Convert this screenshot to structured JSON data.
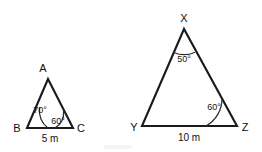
{
  "figure": {
    "background_color": "#ffffff",
    "stroke_color": "#1a1a1a",
    "text_color": "#111111",
    "triangles": [
      {
        "id": "abc",
        "name": "triangle-abc",
        "vertices": [
          {
            "label": "A",
            "role": "apex",
            "x": 48,
            "y": 79
          },
          {
            "label": "B",
            "role": "base-left",
            "x": 27,
            "y": 128
          },
          {
            "label": "C",
            "role": "base-right",
            "x": 73,
            "y": 128
          }
        ],
        "angles": [
          {
            "at": "B",
            "value": "70°"
          },
          {
            "at": "C",
            "value": "60°"
          }
        ],
        "sides": [
          {
            "between": "BC",
            "value": "5 m"
          }
        ]
      },
      {
        "id": "xyz",
        "name": "triangle-xyz",
        "vertices": [
          {
            "label": "X",
            "role": "apex",
            "x": 184,
            "y": 29
          },
          {
            "label": "Y",
            "role": "base-left",
            "x": 142,
            "y": 126
          },
          {
            "label": "Z",
            "role": "base-right",
            "x": 237,
            "y": 126
          }
        ],
        "angles": [
          {
            "at": "X",
            "value": "50°"
          },
          {
            "at": "Z",
            "value": "60°"
          }
        ],
        "sides": [
          {
            "between": "YZ",
            "value": "10 m"
          }
        ]
      }
    ]
  }
}
